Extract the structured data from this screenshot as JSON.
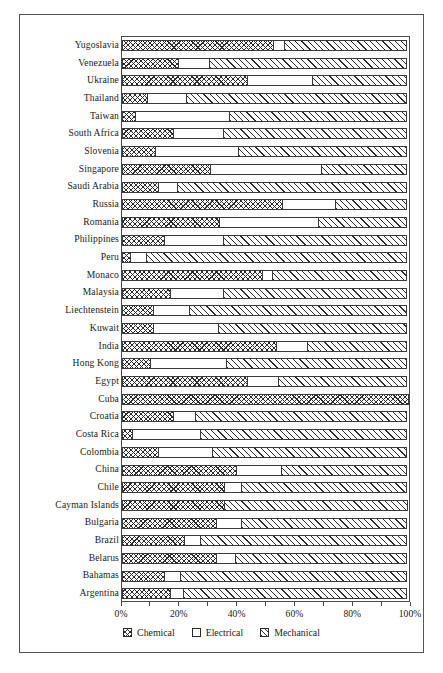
{
  "chart_data": {
    "type": "bar",
    "orientation": "horizontal",
    "stacked": true,
    "normalized_percent": true,
    "title": "",
    "subtitle": "",
    "xlabel": "",
    "ylabel": "",
    "xlim": [
      0,
      100
    ],
    "grid": false,
    "legend_position": "bottom",
    "tick_labels": [
      "0%",
      "20%",
      "40%",
      "60%",
      "80%",
      "100%"
    ],
    "tick_values": [
      0,
      20,
      40,
      60,
      80,
      100
    ],
    "minor_tick_values": [
      10,
      30,
      50,
      70,
      90
    ],
    "legend": [
      {
        "name": "Chemical",
        "pattern": "cross-hatch"
      },
      {
        "name": "Electrical",
        "pattern": "solid-white"
      },
      {
        "name": "Mechanical",
        "pattern": "diagonal-hatch"
      }
    ],
    "categories": [
      "Yugoslavia",
      "Venezuela",
      "Ukraine",
      "Thailand",
      "Taiwan",
      "South Africa",
      "Slovenia",
      "Singapore",
      "Saudi Arabia",
      "Russia",
      "Romania",
      "Philippines",
      "Peru",
      "Monaco",
      "Malaysia",
      "Liechtenstein",
      "Kuwait",
      "India",
      "Hong Kong",
      "Egypt",
      "Cuba",
      "Croatia",
      "Costa Rica",
      "Colombia",
      "China",
      "Chile",
      "Cayman Islands",
      "Bulgaria",
      "Brazil",
      "Belarus",
      "Bahamas",
      "Argentina"
    ],
    "series": [
      {
        "name": "Chemical",
        "values": [
          53,
          20,
          44,
          9,
          5,
          18,
          12,
          31,
          13,
          56,
          34,
          15,
          3,
          49,
          17,
          11,
          11,
          54,
          10,
          44,
          100,
          18,
          4,
          13,
          40,
          36,
          36,
          33,
          22,
          33,
          15,
          17
        ]
      },
      {
        "name": "Electrical",
        "values": [
          57,
          31,
          67,
          23,
          38,
          36,
          41,
          70,
          20,
          75,
          69,
          36,
          9,
          53,
          36,
          24,
          34,
          65,
          37,
          55,
          100,
          26,
          28,
          32,
          56,
          42,
          36,
          42,
          28,
          40,
          21,
          22
        ]
      },
      {
        "name": "Mechanical",
        "values": [
          100,
          100,
          100,
          100,
          100,
          100,
          100,
          100,
          100,
          100,
          100,
          100,
          100,
          100,
          100,
          100,
          100,
          100,
          100,
          100,
          100,
          100,
          100,
          100,
          100,
          100,
          100,
          100,
          100,
          100,
          100,
          100
        ]
      }
    ],
    "segments": [
      {
        "category": "Yugoslavia",
        "chemical": 53,
        "electrical": 4,
        "mechanical": 43
      },
      {
        "category": "Venezuela",
        "chemical": 20,
        "electrical": 11,
        "mechanical": 69
      },
      {
        "category": "Ukraine",
        "chemical": 44,
        "electrical": 23,
        "mechanical": 33
      },
      {
        "category": "Thailand",
        "chemical": 9,
        "electrical": 14,
        "mechanical": 77
      },
      {
        "category": "Taiwan",
        "chemical": 5,
        "electrical": 33,
        "mechanical": 62
      },
      {
        "category": "South Africa",
        "chemical": 18,
        "electrical": 18,
        "mechanical": 64
      },
      {
        "category": "Slovenia",
        "chemical": 12,
        "electrical": 29,
        "mechanical": 59
      },
      {
        "category": "Singapore",
        "chemical": 31,
        "electrical": 39,
        "mechanical": 30
      },
      {
        "category": "Saudi Arabia",
        "chemical": 13,
        "electrical": 7,
        "mechanical": 80
      },
      {
        "category": "Russia",
        "chemical": 56,
        "electrical": 19,
        "mechanical": 25
      },
      {
        "category": "Romania",
        "chemical": 34,
        "electrical": 35,
        "mechanical": 31
      },
      {
        "category": "Philippines",
        "chemical": 15,
        "electrical": 21,
        "mechanical": 64
      },
      {
        "category": "Peru",
        "chemical": 3,
        "electrical": 6,
        "mechanical": 91
      },
      {
        "category": "Monaco",
        "chemical": 49,
        "electrical": 4,
        "mechanical": 47
      },
      {
        "category": "Malaysia",
        "chemical": 17,
        "electrical": 19,
        "mechanical": 64
      },
      {
        "category": "Liechtenstein",
        "chemical": 11,
        "electrical": 13,
        "mechanical": 76
      },
      {
        "category": "Kuwait",
        "chemical": 11,
        "electrical": 23,
        "mechanical": 66
      },
      {
        "category": "India",
        "chemical": 54,
        "electrical": 11,
        "mechanical": 35
      },
      {
        "category": "Hong Kong",
        "chemical": 10,
        "electrical": 27,
        "mechanical": 63
      },
      {
        "category": "Egypt",
        "chemical": 44,
        "electrical": 11,
        "mechanical": 45
      },
      {
        "category": "Cuba",
        "chemical": 100,
        "electrical": 0,
        "mechanical": 0
      },
      {
        "category": "Croatia",
        "chemical": 18,
        "electrical": 8,
        "mechanical": 74
      },
      {
        "category": "Costa Rica",
        "chemical": 4,
        "electrical": 24,
        "mechanical": 72
      },
      {
        "category": "Colombia",
        "chemical": 13,
        "electrical": 19,
        "mechanical": 68
      },
      {
        "category": "China",
        "chemical": 40,
        "electrical": 16,
        "mechanical": 44
      },
      {
        "category": "Chile",
        "chemical": 36,
        "electrical": 6,
        "mechanical": 58
      },
      {
        "category": "Cayman Islands",
        "chemical": 36,
        "electrical": 0,
        "mechanical": 64
      },
      {
        "category": "Bulgaria",
        "chemical": 33,
        "electrical": 9,
        "mechanical": 58
      },
      {
        "category": "Brazil",
        "chemical": 22,
        "electrical": 6,
        "mechanical": 72
      },
      {
        "category": "Belarus",
        "chemical": 33,
        "electrical": 7,
        "mechanical": 60
      },
      {
        "category": "Bahamas",
        "chemical": 15,
        "electrical": 6,
        "mechanical": 79
      },
      {
        "category": "Argentina",
        "chemical": 17,
        "electrical": 5,
        "mechanical": 78
      }
    ]
  }
}
